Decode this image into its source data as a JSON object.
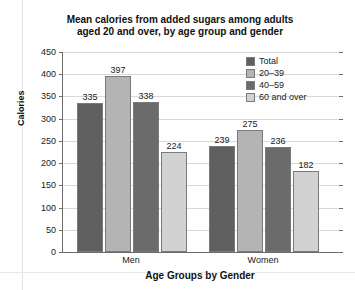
{
  "chart_data": {
    "type": "bar",
    "title": "Mean calories from added sugars among adults aged 20 and over, by age group and gender",
    "title_line1": "Mean calories from added sugars among adults",
    "title_line2": "aged 20 and over, by age group and gender",
    "xlabel": "Age Groups by Gender",
    "ylabel": "Calories",
    "categories": [
      "Men",
      "Women"
    ],
    "ylim": [
      0,
      450
    ],
    "yticks": [
      0,
      50,
      100,
      150,
      200,
      250,
      300,
      350,
      400,
      450
    ],
    "grid": true,
    "legend_position": "top-right",
    "series": [
      {
        "name": "Total",
        "values": [
          335,
          397
        ],
        "color": "#5f5f5f"
      },
      {
        "name": "20–39",
        "values": [
          397,
          275
        ],
        "color": "#b4b4b4"
      },
      {
        "name": "40–59",
        "values": [
          338,
          236
        ],
        "color": "#6b6b6b"
      },
      {
        "name": "60 and over",
        "values": [
          224,
          182
        ],
        "color": "#d2d2d2"
      }
    ],
    "bars": [
      {
        "group": "Men",
        "series": "Total",
        "value": 335,
        "label": "335",
        "color": "#5f5f5f"
      },
      {
        "group": "Men",
        "series": "20–39",
        "value": 397,
        "label": "397",
        "color": "#b4b4b4"
      },
      {
        "group": "Men",
        "series": "40–59",
        "value": 338,
        "label": "338",
        "color": "#6b6b6b"
      },
      {
        "group": "Men",
        "series": "60 and over",
        "value": 224,
        "label": "224",
        "color": "#d2d2d2"
      },
      {
        "group": "Women",
        "series": "Total",
        "value": 239,
        "label": "239",
        "color": "#5f5f5f"
      },
      {
        "group": "Women",
        "series": "20–39",
        "value": 275,
        "label": "275",
        "color": "#b4b4b4"
      },
      {
        "group": "Women",
        "series": "40–59",
        "value": 236,
        "label": "236",
        "color": "#6b6b6b"
      },
      {
        "group": "Women",
        "series": "60 and over",
        "value": 182,
        "label": "182",
        "color": "#d2d2d2"
      }
    ]
  },
  "axis": {
    "y_tick_labels": [
      "450",
      "400",
      "350",
      "300",
      "250",
      "200",
      "150",
      "100",
      "50",
      "0"
    ],
    "y_title": "Calories",
    "x_title": "Age Groups by Gender",
    "group_labels": [
      "Men",
      "Women"
    ]
  },
  "legend": {
    "items": [
      {
        "label": "Total",
        "color": "#5f5f5f"
      },
      {
        "label": "20–39",
        "color": "#b4b4b4"
      },
      {
        "label": "40–59",
        "color": "#6b6b6b"
      },
      {
        "label": "60 and over",
        "color": "#d2d2d2"
      }
    ]
  }
}
